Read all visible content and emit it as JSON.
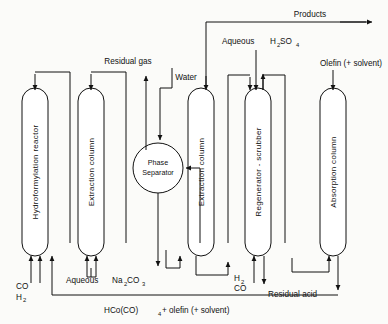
{
  "diagram": {
    "type": "process-flow-diagram",
    "units": [
      {
        "id": "hydroformylation-reactor",
        "label": "Hydroformylation reactor",
        "shape": "column",
        "x": 22,
        "y": 88,
        "w": 26,
        "h": 168
      },
      {
        "id": "extraction-column-1",
        "label": "Extraction column",
        "shape": "column",
        "x": 78,
        "y": 88,
        "w": 26,
        "h": 168
      },
      {
        "id": "phase-separator",
        "label_line1": "Phase",
        "label_line2": "Separator",
        "shape": "circle",
        "cx": 158,
        "cy": 168,
        "r": 25
      },
      {
        "id": "extraction-column-2",
        "label": "Extraction column",
        "shape": "column",
        "x": 188,
        "y": 88,
        "w": 26,
        "h": 168
      },
      {
        "id": "regenerator-scrubber",
        "label": "Regenerator - scrubber",
        "shape": "column",
        "x": 245,
        "y": 88,
        "w": 26,
        "h": 168
      },
      {
        "id": "absorption-column",
        "label": "Absorption column",
        "shape": "column",
        "x": 320,
        "y": 88,
        "w": 26,
        "h": 168
      }
    ],
    "streams": [
      {
        "id": "co-h2-feed",
        "label_line1": "CO",
        "label_line2": "H2",
        "sub2": "2"
      },
      {
        "id": "aqueous-na2co3-feed",
        "label": "Aqueous  Na2CO3"
      },
      {
        "id": "residual-gas",
        "label": "Residual gas"
      },
      {
        "id": "water-feed",
        "label": "Water"
      },
      {
        "id": "products-out",
        "label": "Products"
      },
      {
        "id": "aqueous-h2so4-feed",
        "label": "Aqueous  H2SO4"
      },
      {
        "id": "olefin-solvent-feed",
        "label": "Olefin (+ solvent)"
      },
      {
        "id": "h2-co-feed",
        "label_line1": "H2",
        "label_line2": "CO"
      },
      {
        "id": "residual-acid-out",
        "label": "Residual acid"
      },
      {
        "id": "hco-co4-olefin-recycle",
        "label": "HCo(CO)4 + olefin (+ solvent)"
      }
    ],
    "labels": {
      "residual_gas": "Residual gas",
      "water": "Water",
      "products": "Products",
      "aqueous": "Aqueous",
      "h2so4_base": "H",
      "h2so4_s": "SO",
      "aqueous_na2co3_prefix": "Aqueous",
      "na2co3_na": "Na",
      "na2co3_co": "CO",
      "olefin": "Olefin (+ solvent)",
      "co": "CO",
      "h_sym": "H",
      "residual_acid": "Residual acid",
      "hco_prefix": "HCo(CO)",
      "hco_suffix": "+ olefin (+ solvent)",
      "phase": "Phase",
      "separator": "Separator",
      "sub_2": "2",
      "sub_3": "3",
      "sub_4": "4"
    },
    "colors": {
      "line": "#111111",
      "text": "#111111",
      "background": "#fbfbf9",
      "vessel_fill": "#ffffff"
    }
  }
}
